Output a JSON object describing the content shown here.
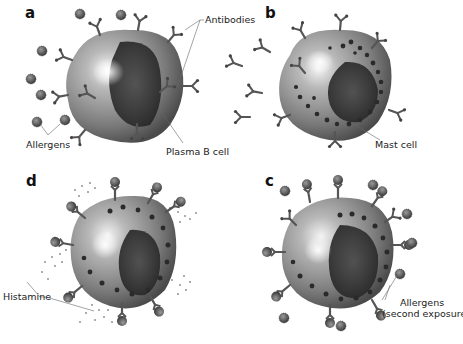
{
  "figure": {
    "panels": [
      {
        "id": "a",
        "letter": "a",
        "cell": "Plasma B cell"
      },
      {
        "id": "b",
        "letter": "b",
        "cell": "Mast cell"
      },
      {
        "id": "c",
        "letter": "c",
        "cell": "Mast cell with allergens bound"
      },
      {
        "id": "d",
        "letter": "d",
        "cell": "Mast cell releasing histamine"
      }
    ],
    "labels": {
      "antibodies": "Antibodies",
      "allergens": "Allergens",
      "plasma_b_cell": "Plasma B cell",
      "mast_cell": "Mast cell",
      "histamine": "Histamine",
      "allergens_second_line1": "Allergens",
      "allergens_second_line2": "(second exposure)"
    },
    "colors": {
      "cell_body": "#8a8a8a",
      "nucleus": "#3a3a3a",
      "granule": "#2a2a2a",
      "antibody": "#555555",
      "allergen": "#5a5a5a",
      "leader_line": "#666666",
      "text": "#222222"
    }
  }
}
